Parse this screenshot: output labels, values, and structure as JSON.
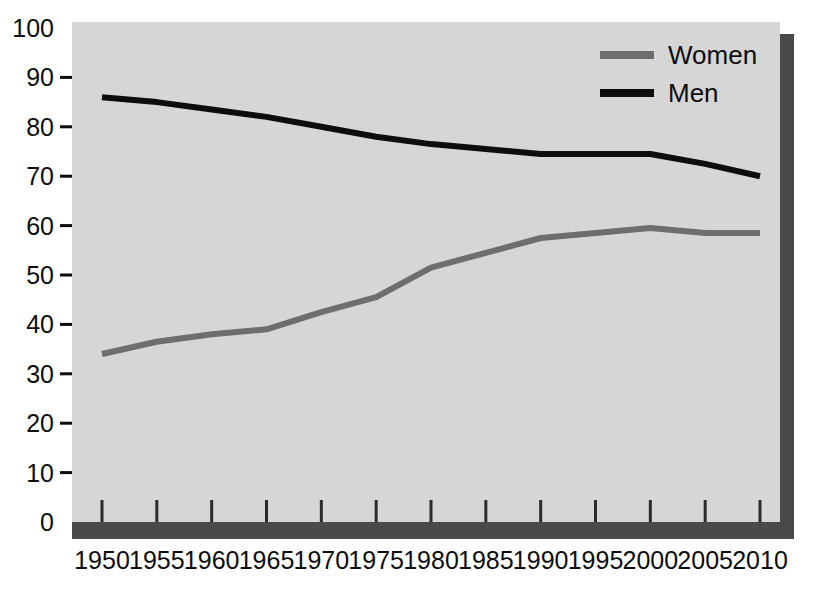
{
  "chart_data": {
    "type": "line",
    "title": "",
    "subtitle": "",
    "xlabel": "",
    "ylabel": "",
    "x": [
      1950,
      1955,
      1960,
      1965,
      1970,
      1975,
      1980,
      1985,
      1990,
      1995,
      2000,
      2005,
      2010
    ],
    "xticklabels": [
      "1950",
      "1955",
      "1960",
      "1965",
      "1970",
      "1975",
      "1980",
      "1985",
      "1990",
      "1995",
      "2000",
      "2005",
      "2010"
    ],
    "yticklabels": [
      "0",
      "10",
      "20",
      "30",
      "40",
      "50",
      "60",
      "70",
      "80",
      "90",
      "100"
    ],
    "yticks": [
      0,
      10,
      20,
      30,
      40,
      50,
      60,
      70,
      80,
      90,
      100
    ],
    "ylim": [
      0,
      100
    ],
    "xlim": [
      1950,
      2010
    ],
    "grid": false,
    "legend_position": "top-right",
    "series": [
      {
        "name": "Women",
        "color": "#6e6e6e",
        "values": [
          34,
          36.5,
          38,
          39,
          42.5,
          45.5,
          51.5,
          54.5,
          57.5,
          58.5,
          59.5,
          58.5,
          58.5
        ]
      },
      {
        "name": "Men",
        "color": "#0d0d0d",
        "values": [
          86,
          85,
          83.5,
          82,
          80,
          78,
          76.5,
          75.5,
          74.5,
          74.5,
          74.5,
          72.5,
          70
        ]
      }
    ]
  },
  "legend": {
    "items": [
      {
        "label": "Women",
        "color": "#6e6e6e"
      },
      {
        "label": "Men",
        "color": "#0d0d0d"
      }
    ]
  },
  "style": {
    "panel_color": "#d6d6d6",
    "shadow_color": "#4a4a4a",
    "background": "#ffffff",
    "axis_color": "#0d0d0d"
  }
}
